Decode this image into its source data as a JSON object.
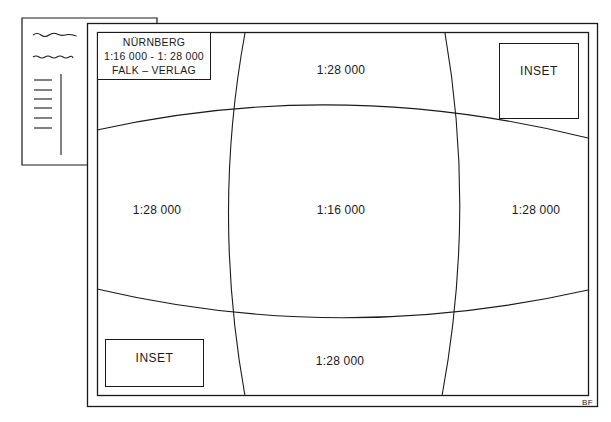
{
  "diagram": {
    "type": "map sheet layout with variable scale zones",
    "title_box": {
      "line1": "NÜRNBERG",
      "line2": "1:16 000 - 1: 28 000",
      "line3": "FALK – VERLAG"
    },
    "zones": {
      "top": "1:28 000",
      "left": "1:28 000",
      "center": "1:16 000",
      "right": "1:28 000",
      "bottom": "1:28 000"
    },
    "insets": {
      "top_right": "INSET",
      "bottom_left": "INSET"
    },
    "credit": "BF",
    "colors": {
      "line": "#1a1a1a",
      "background": "#ffffff"
    }
  }
}
